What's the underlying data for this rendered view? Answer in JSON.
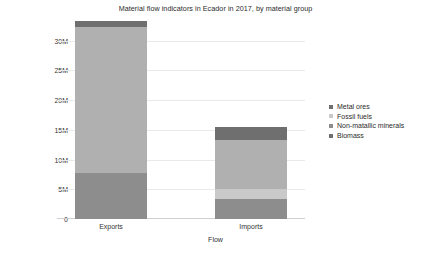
{
  "chart_data": {
    "type": "bar",
    "stacked": true,
    "title": "Material flow indicators in Ecador in 2017, by material group",
    "xlabel": "Flow",
    "ylabel": "tonnes",
    "categories": [
      "Exports",
      "Imports"
    ],
    "ytick_labels": [
      "0",
      "5M",
      "10M",
      "15M",
      "20M",
      "25M",
      "30M"
    ],
    "ytick_values": [
      0,
      5000000,
      10000000,
      15000000,
      20000000,
      25000000,
      30000000
    ],
    "ylim": [
      0,
      33500000
    ],
    "grid": true,
    "legend_position": "right",
    "series": [
      {
        "name": "Metal ores",
        "color": "#6f6f6f",
        "values": [
          900000,
          2200000
        ]
      },
      {
        "name": "Fossil fuels",
        "color": "#c9c9c9",
        "values": [
          0,
          1700000
        ]
      },
      {
        "name": "Non-matallic minerals",
        "color": "#b0b0b0",
        "values": [
          24600000,
          8300000
        ]
      },
      {
        "name": "Biomass",
        "color": "#8d8d8d",
        "values": [
          7800000,
          3300000
        ]
      }
    ],
    "totals": [
      33300000,
      15500000
    ]
  },
  "legend": {
    "items": [
      {
        "label": "Metal ores",
        "color": "#6f6f6f"
      },
      {
        "label": "Fossil fuels",
        "color": "#c9c9c9"
      },
      {
        "label": "Non-matallic minerals",
        "color": "#8d8d8d"
      },
      {
        "label": "Biomass",
        "color": "#6f6f6f"
      }
    ]
  }
}
